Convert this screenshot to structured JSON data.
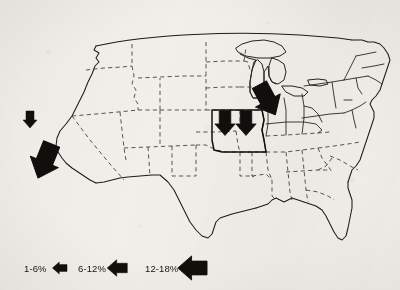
{
  "figure": {
    "kind": "choropleth-arrow-map",
    "region": "United States",
    "background_color": "#f1efea",
    "ink_color": "#100f0c"
  },
  "legend": {
    "name": "magnitude-legend",
    "items": [
      {
        "label": "1-6%",
        "size": "small",
        "arrow_height": 13,
        "arrow_width": 8
      },
      {
        "label": "6-12%",
        "size": "medium",
        "arrow_height": 17,
        "arrow_width": 11
      },
      {
        "label": "12-18%",
        "size": "large",
        "arrow_height": 24,
        "arrow_width": 17
      }
    ]
  },
  "map": {
    "name": "us-states-map",
    "highlighted_states": [
      "Missouri"
    ],
    "markers": [
      {
        "name": "marker-northern-california",
        "category": "1-6%",
        "direction": "down",
        "x": 30,
        "y": 118,
        "scale": 1.0
      },
      {
        "name": "marker-southern-california",
        "category": "12-18%",
        "direction": "down-right",
        "x": 46,
        "y": 158,
        "scale": 2.1
      },
      {
        "name": "marker-missouri-west",
        "category": "6-12%",
        "direction": "down",
        "x": 224,
        "y": 120,
        "scale": 1.45
      },
      {
        "name": "marker-missouri-east",
        "category": "6-12%",
        "direction": "down",
        "x": 245,
        "y": 120,
        "scale": 1.45
      },
      {
        "name": "marker-indiana-michigan",
        "category": "12-18%",
        "direction": "down-left",
        "x": 266,
        "y": 98,
        "scale": 2.0
      }
    ]
  }
}
